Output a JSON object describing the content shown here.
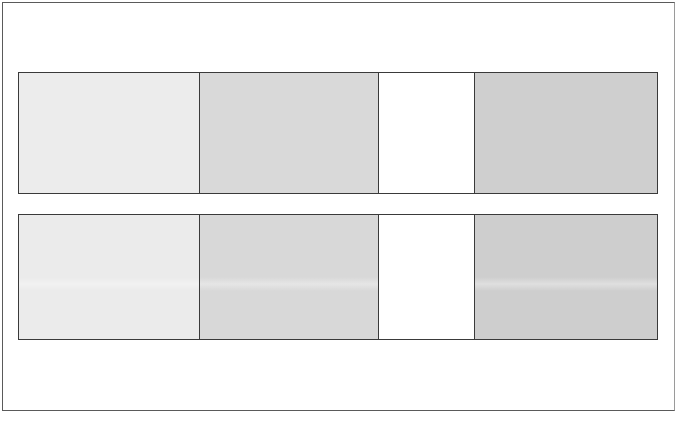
{
  "figure": {
    "rows": [
      {
        "name": "top-row",
        "swatches": [
          {
            "color": "#ececec",
            "width": 182
          },
          {
            "color": "#d9d9d9",
            "width": 179
          },
          {
            "color": "#ffffff",
            "width": 96
          },
          {
            "color": "#cfcfcf",
            "width": 183
          }
        ]
      },
      {
        "name": "bottom-row",
        "swatches": [
          {
            "color": "#ebebeb",
            "width": 182
          },
          {
            "color": "#d8d8d8",
            "width": 179
          },
          {
            "color": "#ffffff",
            "width": 96
          },
          {
            "color": "#cecece",
            "width": 183
          }
        ]
      }
    ],
    "border_color": "#3a3a3a"
  }
}
